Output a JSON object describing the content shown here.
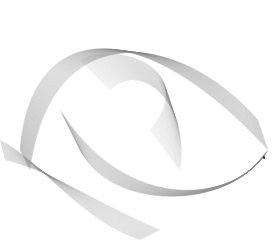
{
  "artwork": {
    "description": "Generative harmonograph-style line mesh forming a folded ribbon surface",
    "background_color": "#ffffff",
    "line_color": "#8a8a8a",
    "dot_color": "#333333",
    "dot_position": {
      "x": 264,
      "y": 157
    }
  }
}
